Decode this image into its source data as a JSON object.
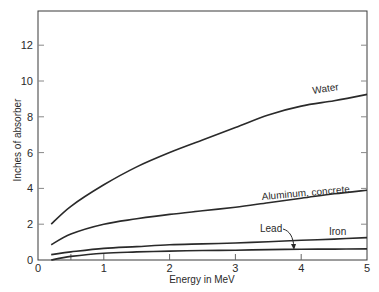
{
  "chart_data": {
    "type": "line",
    "title": "",
    "xlabel": "Energy in MeV",
    "ylabel": "Inches of absorber",
    "xlim": [
      0,
      5
    ],
    "ylim": [
      0,
      14
    ],
    "x_ticks": [
      0,
      1,
      2,
      3,
      4,
      5
    ],
    "x_minor_ticks": [
      0.5
    ],
    "y_ticks": [
      0,
      2,
      4,
      6,
      8,
      10,
      12
    ],
    "grid": false,
    "legend": "none (inline curve labels)",
    "x": [
      0.2,
      0.5,
      1.0,
      1.5,
      2.0,
      2.5,
      3.0,
      3.5,
      4.0,
      4.5,
      5.0
    ],
    "series": [
      {
        "name": "Water",
        "values": [
          2.0,
          3.0,
          4.2,
          5.2,
          6.0,
          6.7,
          7.4,
          8.1,
          8.6,
          8.9,
          9.25
        ]
      },
      {
        "name": "Aluminum, concrete",
        "values": [
          0.85,
          1.45,
          2.0,
          2.3,
          2.55,
          2.75,
          2.95,
          3.2,
          3.45,
          3.7,
          3.9
        ]
      },
      {
        "name": "Iron",
        "values": [
          0.3,
          0.45,
          0.65,
          0.75,
          0.85,
          0.9,
          0.95,
          1.02,
          1.1,
          1.17,
          1.25
        ]
      },
      {
        "name": "Lead",
        "values": [
          0.0,
          0.2,
          0.38,
          0.45,
          0.5,
          0.53,
          0.55,
          0.58,
          0.6,
          0.61,
          0.62
        ]
      }
    ],
    "annotations": [
      {
        "text": "Water",
        "x": 4.3,
        "y": 9.5
      },
      {
        "text": "Aluminum, concrete",
        "x": 3.5,
        "y": 4.2
      },
      {
        "text": "Lead",
        "x": 3.3,
        "y": 1.6,
        "arrow_to": {
          "x": 3.9,
          "y": 0.6
        }
      },
      {
        "text": "Iron",
        "x": 4.4,
        "y": 1.4
      }
    ]
  },
  "labels": {
    "xlabel": "Energy in MeV",
    "ylabel": "Inches of absorber",
    "water": "Water",
    "aluminum": "Aluminum, concrete",
    "lead": "Lead",
    "iron": "Iron"
  }
}
